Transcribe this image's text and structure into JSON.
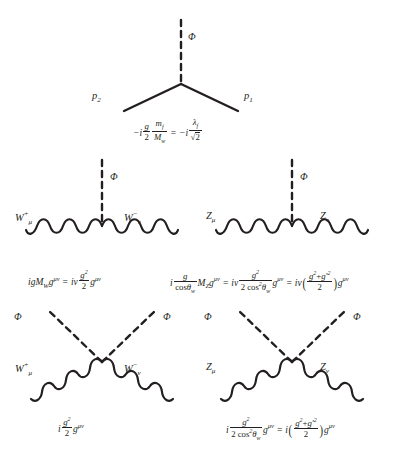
{
  "figure": {
    "background_color": "#ffffff",
    "line_color": "#231f20",
    "width": 406,
    "height": 450
  },
  "diagrams": [
    {
      "id": "fermion-higgs-vertex",
      "name": "Higgs to fermion pair vertex",
      "labels": {
        "higgs": "Φ",
        "left_momentum": "p",
        "left_momentum_sub": "2",
        "right_momentum": "p",
        "right_momentum_sub": "1"
      },
      "formula_text": "-i (g/2)(m_f/M_w) = -i λ_f/√2",
      "formula_parts": {
        "minus_i_1": "−i",
        "g": "g",
        "two_a": "2",
        "m": "m",
        "f_sub_1": "f",
        "M": "M",
        "w_sub": "w",
        "equals": "=",
        "minus_i_2": "−i",
        "lambda": "λ",
        "f_sub_2": "f",
        "sqrt2": "2"
      }
    },
    {
      "id": "www-higgs-vertex",
      "name": "Higgs to W pair vertex",
      "labels": {
        "higgs": "Φ",
        "left_boson": "W",
        "left_boson_sup": "+",
        "left_boson_sub": "μ",
        "right_boson": "W",
        "right_boson_sup": "−",
        "right_boson_sub": "ν"
      },
      "formula_text": "igM_W g^{μν} = iv (g^2/2) g^{μν}",
      "formula_parts": {
        "lead": "igM",
        "W_sub": "W",
        "g1": "g",
        "munu1": "μν",
        "equals": "=",
        "iv": "iv",
        "g_num": "g",
        "sq": "2",
        "den": "2",
        "g2": "g",
        "munu2": "μν"
      }
    },
    {
      "id": "zz-higgs-vertex",
      "name": "Higgs to Z pair vertex",
      "labels": {
        "higgs": "Φ",
        "left_boson": "Z",
        "left_boson_sub": "μ",
        "right_boson": "Z",
        "right_boson_sub": "ν"
      },
      "formula_text": "i (g/cosθ_w) M_Z g^{μν} = iv (g^2/(2cos^2θ_w)) g^{μν} = iv ((g^2+g'^2)/2) g^{μν}",
      "formula_parts": {
        "i1": "i",
        "g_num": "g",
        "cos": "cos",
        "theta": "θ",
        "w_sub1": "w",
        "M": "M",
        "Z_sub": "Z",
        "g_a": "g",
        "munu_a": "μν",
        "eq1": "=",
        "iv": "iv",
        "g_num2": "g",
        "sq2": "2",
        "den2_lead": "2 cos",
        "den2_sup": "2",
        "theta2": "θ",
        "w_sub2": "w",
        "g_b": "g",
        "munu_b": "μν",
        "eq2": "=",
        "iv2": "iv",
        "gg_num": "g",
        "gg_sup1": "2",
        "plus": "+",
        "gp": "g′",
        "gg_sup2": "2",
        "gg_den": "2",
        "g_c": "g",
        "munu_c": "μν"
      }
    },
    {
      "id": "wwhh-vertex",
      "name": "W pair to Higgs pair four point vertex",
      "labels": {
        "higgs_left": "Φ",
        "higgs_right": "Φ",
        "left_boson": "W",
        "left_boson_sup": "+",
        "left_boson_sub": "μ",
        "right_boson": "W",
        "right_boson_sup": "−",
        "right_boson_sub": "ν"
      },
      "formula_text": "i (g^2/2) g^{μν}",
      "formula_parts": {
        "i": "i",
        "g_num": "g",
        "sq": "2",
        "den": "2",
        "g2": "g",
        "munu": "μν"
      }
    },
    {
      "id": "zzhh-vertex",
      "name": "Z pair to Higgs pair four point vertex",
      "labels": {
        "higgs_left": "Φ",
        "higgs_right": "Φ",
        "left_boson": "Z",
        "left_boson_sub": "μ",
        "right_boson": "Z",
        "right_boson_sub": "ν"
      },
      "formula_text": "i (g^2/(2cos^2θ_w)) g^{μν} = i ((g^2+g'^2)/2) g^{μν}",
      "formula_parts": {
        "i1": "i",
        "g_num": "g",
        "sq": "2",
        "den_lead": "2 cos",
        "den_sup": "2",
        "theta": "θ",
        "w_sub": "w",
        "g_a": "g",
        "munu_a": "μν",
        "eq": "=",
        "i2": "i",
        "gg_num": "g",
        "gg_sup1": "2",
        "plus": "+",
        "gp": "g′",
        "gg_sup2": "2",
        "gg_den": "2",
        "g_b": "g",
        "munu_b": "μν"
      }
    }
  ]
}
